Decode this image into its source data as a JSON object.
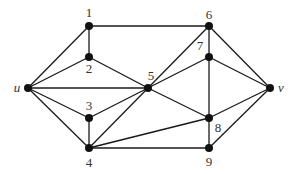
{
  "diagram": {
    "type": "undirected-graph",
    "nodes": [
      {
        "id": "1",
        "label": "1",
        "x": 89,
        "y": 26,
        "lx": 89,
        "ly": 17,
        "italic": false
      },
      {
        "id": "2",
        "label": "2",
        "x": 89,
        "y": 57,
        "lx": 89,
        "ly": 73,
        "italic": false
      },
      {
        "id": "u",
        "label": "u",
        "x": 28,
        "y": 88,
        "lx": 17,
        "ly": 92,
        "italic": true
      },
      {
        "id": "5",
        "label": "5",
        "x": 148,
        "y": 88,
        "lx": 151,
        "ly": 80,
        "italic": false
      },
      {
        "id": "3",
        "label": "3",
        "x": 89,
        "y": 118,
        "lx": 89,
        "ly": 110,
        "italic": false
      },
      {
        "id": "4",
        "label": "4",
        "x": 89,
        "y": 148,
        "lx": 89,
        "ly": 167,
        "italic": false
      },
      {
        "id": "6",
        "label": "6",
        "x": 209,
        "y": 26,
        "lx": 209,
        "ly": 19,
        "italic": false
      },
      {
        "id": "7",
        "label": "7",
        "x": 209,
        "y": 57,
        "lx": 200,
        "ly": 50,
        "italic": false
      },
      {
        "id": "v",
        "label": "v",
        "x": 270,
        "y": 88,
        "lx": 281,
        "ly": 92,
        "italic": true
      },
      {
        "id": "8",
        "label": "8",
        "x": 209,
        "y": 118,
        "lx": 218,
        "ly": 132,
        "italic": false
      },
      {
        "id": "9",
        "label": "9",
        "x": 209,
        "y": 148,
        "lx": 209,
        "ly": 166,
        "italic": false
      }
    ],
    "edges": [
      [
        "u",
        "1"
      ],
      [
        "u",
        "2"
      ],
      [
        "u",
        "5"
      ],
      [
        "u",
        "3"
      ],
      [
        "u",
        "4"
      ],
      [
        "1",
        "2"
      ],
      [
        "1",
        "6"
      ],
      [
        "2",
        "5"
      ],
      [
        "3",
        "5"
      ],
      [
        "3",
        "4"
      ],
      [
        "4",
        "5"
      ],
      [
        "4",
        "8"
      ],
      [
        "4",
        "9"
      ],
      [
        "5",
        "6"
      ],
      [
        "5",
        "7"
      ],
      [
        "5",
        "8"
      ],
      [
        "6",
        "7"
      ],
      [
        "6",
        "v"
      ],
      [
        "7",
        "v"
      ],
      [
        "7",
        "8"
      ],
      [
        "8",
        "9"
      ],
      [
        "8",
        "v"
      ],
      [
        "9",
        "v"
      ]
    ],
    "style": {
      "node_color": "#111111",
      "edge_color": "#1a1a1a",
      "label_color": "#333333",
      "background": "#ffffff"
    }
  }
}
